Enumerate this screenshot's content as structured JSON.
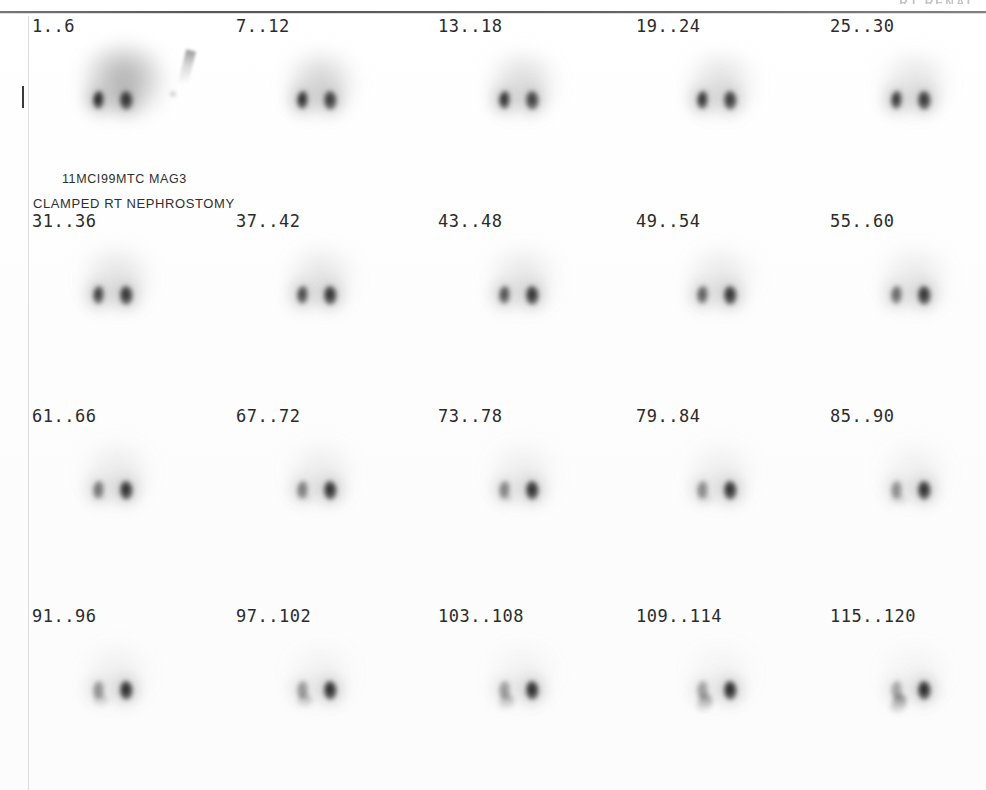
{
  "study": {
    "header_cropped_text": "RT RENAL",
    "annotation_line1": "11MCI99MTC MAG3",
    "annotation_line2": "CLAMPED RT NEPHROSTOMY",
    "modality": "renal-scintigraphy",
    "colors": {
      "paper": "#ffffff",
      "rule": "#4e4e4e",
      "label_text": "#2b2b2b",
      "annotation_text": "#2f2f2f",
      "activity_dark": "#111111",
      "activity_mid": "#6f6f6f",
      "activity_faint": "#cfcfcf"
    }
  },
  "grid": {
    "rows": 4,
    "columns": 5,
    "rows_data": [
      {
        "index": 0,
        "cells": [
          {
            "label": "1..6",
            "left_intensity": 0.98,
            "right_intensity": 0.92,
            "background": 0.55,
            "ureter": 0.0,
            "marker": true,
            "tick": true
          },
          {
            "label": "7..12",
            "left_intensity": 0.95,
            "right_intensity": 0.88,
            "background": 0.32,
            "ureter": 0.0,
            "marker": false,
            "tick": false
          },
          {
            "label": "13..18",
            "left_intensity": 0.93,
            "right_intensity": 0.86,
            "background": 0.26,
            "ureter": 0.0,
            "marker": false,
            "tick": false
          },
          {
            "label": "19..24",
            "left_intensity": 0.92,
            "right_intensity": 0.88,
            "background": 0.22,
            "ureter": 0.0,
            "marker": false,
            "tick": false
          },
          {
            "label": "25..30",
            "left_intensity": 0.9,
            "right_intensity": 0.9,
            "background": 0.2,
            "ureter": 0.0,
            "marker": false,
            "tick": false
          }
        ]
      },
      {
        "index": 1,
        "cells": [
          {
            "label": "31..36",
            "left_intensity": 0.86,
            "right_intensity": 0.92,
            "background": 0.2,
            "ureter": 0.0,
            "marker": false,
            "tick": false
          },
          {
            "label": "37..42",
            "left_intensity": 0.82,
            "right_intensity": 0.92,
            "background": 0.18,
            "ureter": 0.0,
            "marker": false,
            "tick": false
          },
          {
            "label": "43..48",
            "left_intensity": 0.78,
            "right_intensity": 0.92,
            "background": 0.17,
            "ureter": 0.0,
            "marker": false,
            "tick": false
          },
          {
            "label": "49..54",
            "left_intensity": 0.72,
            "right_intensity": 0.92,
            "background": 0.16,
            "ureter": 0.0,
            "marker": false,
            "tick": false
          },
          {
            "label": "55..60",
            "left_intensity": 0.68,
            "right_intensity": 0.92,
            "background": 0.15,
            "ureter": 0.05,
            "marker": false,
            "tick": false
          }
        ]
      },
      {
        "index": 2,
        "cells": [
          {
            "label": "61..66",
            "left_intensity": 0.62,
            "right_intensity": 0.94,
            "background": 0.14,
            "ureter": 0.1,
            "marker": false,
            "tick": false
          },
          {
            "label": "67..72",
            "left_intensity": 0.58,
            "right_intensity": 0.94,
            "background": 0.13,
            "ureter": 0.14,
            "marker": false,
            "tick": false
          },
          {
            "label": "73..78",
            "left_intensity": 0.55,
            "right_intensity": 0.94,
            "background": 0.12,
            "ureter": 0.18,
            "marker": false,
            "tick": false
          },
          {
            "label": "79..84",
            "left_intensity": 0.52,
            "right_intensity": 0.94,
            "background": 0.11,
            "ureter": 0.22,
            "marker": false,
            "tick": false
          },
          {
            "label": "85..90",
            "left_intensity": 0.5,
            "right_intensity": 0.94,
            "background": 0.1,
            "ureter": 0.26,
            "marker": false,
            "tick": false
          }
        ]
      },
      {
        "index": 3,
        "cells": [
          {
            "label": "91..96",
            "left_intensity": 0.48,
            "right_intensity": 0.96,
            "background": 0.09,
            "ureter": 0.34,
            "marker": false,
            "tick": false
          },
          {
            "label": "97..102",
            "left_intensity": 0.46,
            "right_intensity": 0.96,
            "background": 0.08,
            "ureter": 0.42,
            "marker": false,
            "tick": false
          },
          {
            "label": "103..108",
            "left_intensity": 0.44,
            "right_intensity": 0.96,
            "background": 0.08,
            "ureter": 0.48,
            "marker": false,
            "tick": false
          },
          {
            "label": "109..114",
            "left_intensity": 0.42,
            "right_intensity": 0.97,
            "background": 0.07,
            "ureter": 0.62,
            "marker": false,
            "tick": false
          },
          {
            "label": "115..120",
            "left_intensity": 0.4,
            "right_intensity": 0.97,
            "background": 0.07,
            "ureter": 0.7,
            "marker": false,
            "tick": false
          }
        ]
      }
    ]
  }
}
